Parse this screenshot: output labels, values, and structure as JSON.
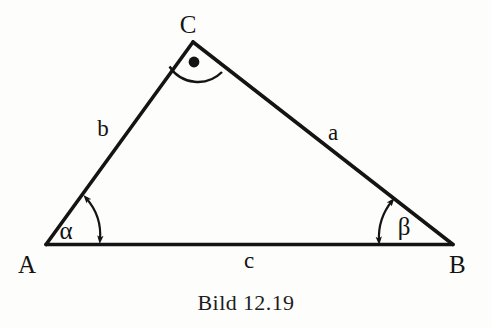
{
  "figure": {
    "caption": "Bild 12.19",
    "background_color": "#fdfdfc",
    "stroke_color": "#141414",
    "vertices": [
      {
        "name": "A",
        "label": "A",
        "x": 46,
        "y": 244
      },
      {
        "name": "B",
        "label": "B",
        "x": 453,
        "y": 244
      },
      {
        "name": "C",
        "label": "C",
        "x": 193,
        "y": 42
      }
    ],
    "sides": [
      {
        "name": "a",
        "label": "a",
        "from": "B",
        "to": "C",
        "label_x": 333,
        "label_y": 140
      },
      {
        "name": "b",
        "label": "b",
        "from": "A",
        "to": "C",
        "label_x": 103,
        "label_y": 136
      },
      {
        "name": "c",
        "label": "c",
        "from": "A",
        "to": "B",
        "label_x": 249,
        "label_y": 268
      }
    ],
    "angles": [
      {
        "name": "alpha",
        "label": "α",
        "at_vertex": "A",
        "label_x": 66,
        "label_y": 239
      },
      {
        "name": "beta",
        "label": "β",
        "at_vertex": "B",
        "label_x": 398,
        "label_y": 235
      }
    ],
    "right_angle_marker": {
      "at_vertex": "C",
      "symbol": "right-angle-dot-arc",
      "dot_x": 194,
      "dot_y": 62
    }
  }
}
